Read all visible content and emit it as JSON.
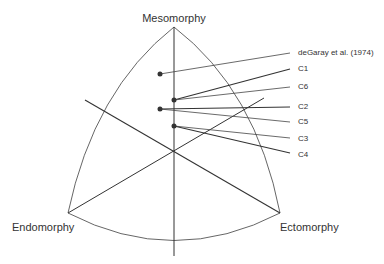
{
  "diagram": {
    "vertices": {
      "top": "Mesomorphy",
      "left": "Endomorphy",
      "right": "Ectomorphy"
    },
    "points": [
      {
        "label": "deGaray et al. (1974)",
        "x": 160,
        "y": 74
      },
      {
        "label": "C1",
        "x": 174,
        "y": 100
      },
      {
        "label": "C6",
        "x": 174,
        "y": 100
      },
      {
        "label": "C2",
        "x": 160,
        "y": 109
      },
      {
        "label": "C5",
        "x": 160,
        "y": 109
      },
      {
        "label": "C3",
        "x": 174,
        "y": 126
      },
      {
        "label": "C4",
        "x": 174,
        "y": 126
      }
    ],
    "colors": {
      "line": "#333333",
      "frame": "#555555",
      "text": "#333333"
    }
  }
}
